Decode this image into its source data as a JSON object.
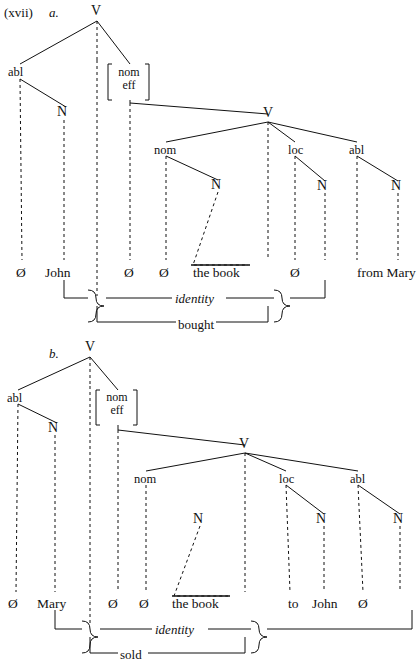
{
  "figure": {
    "example_number": "(xvii)",
    "domain": "linguistic-syntax-tree",
    "panels": [
      {
        "letter": "a.",
        "verb": "bought",
        "identity_label": "identity",
        "root": "V",
        "nodes": {
          "root": "V",
          "outer_abl": "abl",
          "bracket_line1": "nom",
          "bracket_line2": "eff",
          "outer_n": "N",
          "inner_v": "V",
          "inner_nom": "nom",
          "inner_nom_n": "N",
          "inner_loc": "loc",
          "inner_loc_n": "N",
          "inner_abl": "abl",
          "inner_abl_n": "N"
        },
        "leaves": [
          {
            "text": "Ø",
            "x": 22
          },
          {
            "text": "John",
            "x": 55
          },
          {
            "text": "Ø",
            "x": 128
          },
          {
            "text": "Ø",
            "x": 163
          },
          {
            "text": "the book",
            "x": 192
          },
          {
            "text": "Ø",
            "x": 294
          },
          {
            "text": "from Mary",
            "x": 355
          }
        ],
        "triangle_text": "the book"
      },
      {
        "letter": "b.",
        "verb": "sold",
        "identity_label": "identity",
        "root": "V",
        "nodes": {
          "root": "V",
          "outer_abl": "abl",
          "bracket_line1": "nom",
          "bracket_line2": "eff",
          "outer_n": "N",
          "inner_v": "V",
          "inner_nom": "nom",
          "inner_nom_n": "N",
          "inner_loc": "loc",
          "inner_loc_n": "N",
          "inner_abl": "abl",
          "inner_abl_n": "N"
        },
        "leaves": [
          {
            "text": "Ø",
            "x": 14
          },
          {
            "text": "Mary",
            "x": 43
          },
          {
            "text": "Ø",
            "x": 112
          },
          {
            "text": "Ø",
            "x": 143
          },
          {
            "text": "the book",
            "x": 172
          },
          {
            "text": "to",
            "x": 292
          },
          {
            "text": "John",
            "x": 320
          },
          {
            "text": "Ø",
            "x": 361
          }
        ],
        "triangle_text": "the book"
      }
    ],
    "colors": {
      "ink": "#111111",
      "paper": "#ffffff"
    }
  }
}
